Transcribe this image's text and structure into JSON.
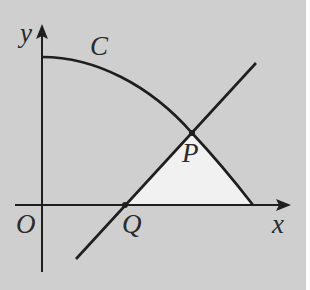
{
  "figure": {
    "background_color": "#cfcfcf",
    "shade_color": "#f1f1f1",
    "stroke_color": "#1e1e1e",
    "labels": {
      "y_axis": "y",
      "x_axis": "x",
      "origin": "O",
      "curve": "C",
      "point_p": "P",
      "point_q": "Q"
    },
    "elements": [
      {
        "kind": "axis",
        "name": "x-axis",
        "label": "x"
      },
      {
        "kind": "axis",
        "name": "y-axis",
        "label": "y"
      },
      {
        "kind": "curve",
        "name": "C",
        "description": "decreasing concave curve from y-axis intercept down to x-axis"
      },
      {
        "kind": "line",
        "name": "straight line through Q and P",
        "description": "positive slope line crossing x-axis at Q and curve C at P"
      },
      {
        "kind": "point",
        "name": "P",
        "description": "intersection of line and curve C"
      },
      {
        "kind": "point",
        "name": "Q",
        "description": "intersection of line and x-axis"
      },
      {
        "kind": "region",
        "name": "shaded region",
        "description": "region bounded by line QP, curve C from P to x-axis, and the x-axis"
      }
    ]
  }
}
